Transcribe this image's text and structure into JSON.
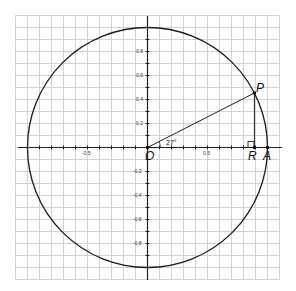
{
  "diagram": {
    "angle_label": "27°",
    "angle_degrees": 27,
    "points": {
      "origin": "O",
      "p": "P",
      "r": "R",
      "a": "A"
    },
    "x_tick_labels": [
      "-0.5",
      "0.5"
    ],
    "y_tick_labels": [
      "0.8",
      "0.6",
      "0.4",
      "0.2",
      "-0.2",
      "-0.4",
      "-0.6",
      "-0.8"
    ],
    "colors": {
      "grid": "#c8c8c8",
      "axis": "#222222",
      "circle": "#1a1a1a",
      "background": "#ffffff"
    }
  }
}
